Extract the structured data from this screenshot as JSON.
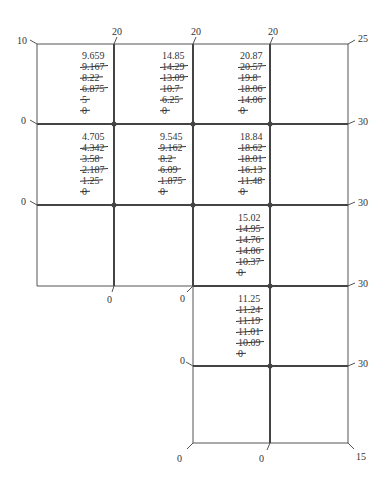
{
  "diagram": {
    "type": "finite-difference relaxation grid",
    "cells": [
      {
        "id": "c1",
        "final": "9.659",
        "iterations": [
          "9.167",
          "8.22",
          "6.875",
          "5",
          "0"
        ]
      },
      {
        "id": "c2",
        "final": "14.85",
        "iterations": [
          "14.29",
          "13.09",
          "10.7",
          "6.25",
          "0"
        ]
      },
      {
        "id": "c3",
        "final": "20.87",
        "iterations": [
          "20.57",
          "19.8",
          "18.06",
          "14.06",
          "0"
        ]
      },
      {
        "id": "c4",
        "final": "4.705",
        "iterations": [
          "4.342",
          "3.58",
          "2.187",
          "1.25",
          "0"
        ]
      },
      {
        "id": "c5",
        "final": "9.545",
        "iterations": [
          "9.162",
          "8.2",
          "6.09",
          "1.875",
          "0"
        ]
      },
      {
        "id": "c6",
        "final": "18.84",
        "iterations": [
          "18.62",
          "18.01",
          "16.13",
          "11.48",
          "0"
        ]
      },
      {
        "id": "c7",
        "final": "15.02",
        "iterations": [
          "14.95",
          "14.76",
          "14.06",
          "10.37",
          "0"
        ]
      },
      {
        "id": "c8",
        "final": "11.25",
        "iterations": [
          "11.24",
          "11.19",
          "11.01",
          "10.09",
          "0"
        ]
      }
    ],
    "boundary_labels": {
      "top_left": "10",
      "top_1": "20",
      "top_2": "20",
      "top_3": "20",
      "top_right": "25",
      "left_row1": "0",
      "left_row2": "0",
      "right_row1": "30",
      "right_row2": "30",
      "right_row3": "30",
      "right_row4": "30",
      "bottom_step1": "0",
      "bottom_step2": "0",
      "left_row4": "0",
      "bottom_left": "0",
      "bottom_mid": "0",
      "bottom_right": "15"
    }
  }
}
